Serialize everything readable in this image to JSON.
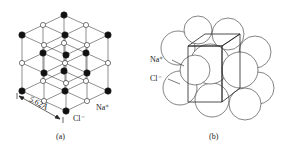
{
  "figure": {
    "panel_a": {
      "caption": "(a)",
      "dimension_label": "5.62Å",
      "ion_labels": {
        "na": "Na⁺",
        "cl": "Cl⁻"
      },
      "description": "NaCl rock-salt lattice, ball-and-stick"
    },
    "panel_b": {
      "caption": "(b)",
      "ion_labels": {
        "na": "Na⁺",
        "cl": "Cl⁻"
      },
      "description": "NaCl space-filling model with unit cell cube"
    },
    "colors": {
      "cl_ion": "#111111",
      "na_ion": "#ffffff",
      "line": "#333333"
    }
  }
}
